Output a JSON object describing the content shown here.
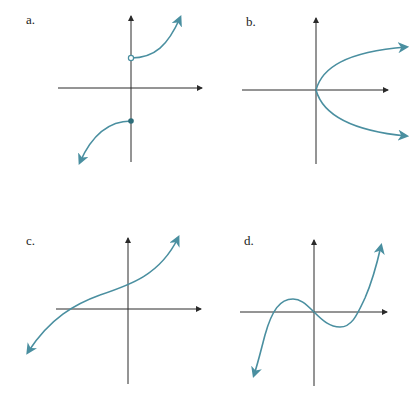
{
  "colors": {
    "axis": "#2a2a2a",
    "curve": "#4a8fa0"
  },
  "panels": [
    {
      "id": "a",
      "label": "a.",
      "description": "Piecewise curve: open circle on y-axis above origin, increasing to the upper right; closed dot on y-axis below origin, curve descending to lower left"
    },
    {
      "id": "b",
      "label": "b.",
      "description": "Sideways parabola opening to the right, vertex at origin"
    },
    {
      "id": "c",
      "label": "c.",
      "description": "Increasing cubic-like curve crossing x-axis left of origin and y-axis above origin"
    },
    {
      "id": "d",
      "label": "d.",
      "description": "Cubic with local max left of origin, passes through origin, local min right of origin"
    }
  ]
}
